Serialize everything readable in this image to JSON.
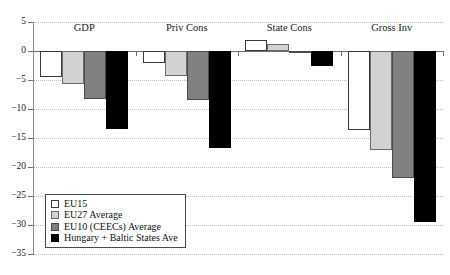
{
  "chart_data": {
    "type": "bar",
    "title": "",
    "subtitle": "",
    "xlabel": "",
    "ylabel": "",
    "categories": [
      "GDP",
      "Priv Cons",
      "State Cons",
      "Gross Inv"
    ],
    "series": [
      {
        "name": "EU15",
        "color": "#ffffff",
        "values": [
          -4.5,
          -2.0,
          1.9,
          -13.6
        ]
      },
      {
        "name": "EU27 Average",
        "color": "#d2d2d2",
        "values": [
          -5.7,
          -4.3,
          1.2,
          -17.0
        ]
      },
      {
        "name": "EU10 (CEECs) Average",
        "color": "#808080",
        "values": [
          -8.3,
          -8.5,
          -0.2,
          -21.9
        ]
      },
      {
        "name": "Hungary + Baltic States Ave",
        "color": "#000000",
        "values": [
          -13.5,
          -16.8,
          -2.6,
          -29.5
        ]
      }
    ],
    "ylim": [
      -35,
      5
    ],
    "yticks": [
      5,
      0,
      -5,
      -10,
      -15,
      -20,
      -25,
      -30,
      -35
    ],
    "ytick_labels": [
      "5",
      "0",
      "−5",
      "−10",
      "−15",
      "−20",
      "−25",
      "−30",
      "−35"
    ],
    "grid": true,
    "grid_axis": "y",
    "grid_style": "dotted",
    "legend_position": "bottom-left",
    "zero_line": true
  },
  "legend": {
    "items": [
      {
        "label": "EU15",
        "swatch": "white-swatch"
      },
      {
        "label": "EU27 Average",
        "swatch": "light-gray-swatch"
      },
      {
        "label": "EU10 (CEECs) Average",
        "swatch": "mid-gray-swatch"
      },
      {
        "label": "Hungary + Baltic States Ave",
        "swatch": "black-swatch"
      }
    ]
  },
  "colors": {
    "eu15": "#ffffff",
    "eu27": "#d2d2d2",
    "eu10": "#808080",
    "hungary_baltic": "#000000",
    "axis": "#6e6e6e",
    "grid": "#bdbdbd",
    "background": "#ffffff"
  }
}
